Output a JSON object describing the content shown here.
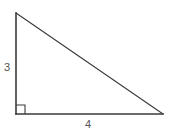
{
  "figure": {
    "type": "right-triangle",
    "background_color": "#ffffff",
    "stroke_color": "#3a3a3a",
    "label_color": "#555555",
    "canvas": {
      "width": 188,
      "height": 134
    },
    "vertices": {
      "top": {
        "x": 16,
        "y": 13
      },
      "bottom_left": {
        "x": 16,
        "y": 114
      },
      "bottom_right": {
        "x": 163,
        "y": 114
      }
    },
    "sides": [
      {
        "name": "vertical-leg",
        "label": "3",
        "from": "top",
        "to": "bottom_left",
        "stroke_width": 1.6
      },
      {
        "name": "horizontal-leg",
        "label": "4",
        "from": "bottom_left",
        "to": "bottom_right",
        "stroke_width": 1.6
      },
      {
        "name": "hypotenuse",
        "label": "",
        "from": "top",
        "to": "bottom_right",
        "stroke_width": 1.1
      }
    ],
    "right_angle_marker": {
      "name": "right-angle-square",
      "at_vertex": "bottom_left",
      "size": 9,
      "stroke_width": 1.1
    },
    "labels": {
      "vertical_leg": "3",
      "horizontal_leg": "4"
    }
  },
  "chart_data": {
    "type": "diagram",
    "categories": [
      "vertical leg",
      "horizontal leg"
    ],
    "values": [
      3,
      4
    ],
    "annotations": [
      "3",
      "4"
    ],
    "xlabel": "",
    "ylabel": ""
  }
}
